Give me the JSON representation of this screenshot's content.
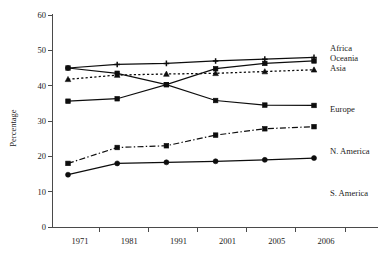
{
  "chart_data": {
    "type": "line",
    "title": "",
    "subtitle": "",
    "xlabel": "",
    "ylabel": "Percentage",
    "categories": [
      "1971",
      "1981",
      "1991",
      "2001",
      "2005",
      "2006"
    ],
    "x_tick_labels": [
      "1971",
      "1981",
      "1991",
      "2001",
      "2005",
      "2006"
    ],
    "y_tick_labels": [
      "0",
      "10",
      "20",
      "30",
      "40",
      "50",
      "60"
    ],
    "y_ticks": [
      0,
      10,
      20,
      30,
      40,
      50,
      60
    ],
    "ylim": [
      0,
      60
    ],
    "grid": false,
    "legend_position": "right-inline",
    "series": [
      {
        "name": "Africa",
        "label": "Africa",
        "values": [
          45,
          46,
          46.3,
          47,
          47.5,
          48
        ],
        "marker": "plus",
        "line_style": "solid",
        "color": "#0d0d0d"
      },
      {
        "name": "Oceania",
        "label": "Oceania",
        "values": [
          45,
          43.5,
          40.3,
          44.8,
          46.3,
          47
        ],
        "marker": "square",
        "line_style": "solid",
        "color": "#0d0d0d"
      },
      {
        "name": "Asia",
        "label": "Asia",
        "values": [
          41.8,
          43,
          43.3,
          43.5,
          44,
          44.5
        ],
        "marker": "triangle",
        "line_style": "dotted",
        "color": "#0d0d0d"
      },
      {
        "name": "Europe",
        "label": "Europe",
        "values": [
          35.6,
          36.3,
          40.3,
          35.8,
          34.5,
          34.4
        ],
        "marker": "square",
        "line_style": "solid",
        "color": "#0d0d0d"
      },
      {
        "name": "N. America",
        "label": "N. America",
        "values": [
          18,
          22.5,
          23,
          26,
          27.8,
          28.4
        ],
        "marker": "square",
        "line_style": "dashdot",
        "color": "#333333"
      },
      {
        "name": "S. America",
        "label": "S. America",
        "values": [
          14.8,
          18,
          18.3,
          18.6,
          19,
          19.5
        ],
        "marker": "circle",
        "line_style": "solid",
        "color": "#0d0d0d"
      }
    ]
  },
  "legend": {
    "items": [
      {
        "label": "Africa"
      },
      {
        "label": "Oceania"
      },
      {
        "label": "Asia"
      },
      {
        "label": "Europe"
      },
      {
        "label": "N. America"
      },
      {
        "label": "S. America"
      }
    ]
  }
}
